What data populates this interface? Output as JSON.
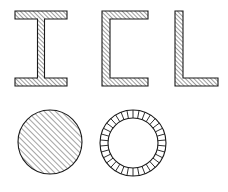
{
  "drawing": {
    "title": "Structural steel cross-sections",
    "background_color": "#ffffff",
    "line_color": "#1a1a1a",
    "hatch_color": "#4a4a4a",
    "canvas": {
      "width": 228,
      "height": 192
    },
    "row_count": 2,
    "shape_count": 5
  },
  "shapes": [
    {
      "id": "i-beam",
      "name": "I-beam section",
      "profile_letter": "I",
      "row": 1,
      "column": 1,
      "hatch_style": "diagonal-45",
      "hatch_spacing_px": 3,
      "bounds": {
        "x": 15,
        "y": 11,
        "width": 52,
        "height": 75
      },
      "flange_thickness_px": 8,
      "web_thickness_px": 7,
      "web_center_x": 41
    },
    {
      "id": "c-channel",
      "name": "C-channel section",
      "profile_letter": "C",
      "row": 1,
      "column": 2,
      "hatch_style": "diagonal-45",
      "hatch_spacing_px": 3,
      "bounds": {
        "x": 102,
        "y": 11,
        "width": 46,
        "height": 75
      },
      "flange_thickness_px": 8,
      "web_thickness_px": 8
    },
    {
      "id": "l-angle",
      "name": "L-angle section",
      "profile_letter": "L",
      "row": 1,
      "column": 3,
      "hatch_style": "diagonal-45",
      "hatch_spacing_px": 3,
      "bounds": {
        "x": 175,
        "y": 11,
        "width": 43,
        "height": 75
      },
      "leg_thickness_px": 8
    },
    {
      "id": "solid-round-bar",
      "name": "Solid round bar section",
      "profile_letter": "O",
      "row": 2,
      "column": 1,
      "hatch_style": "diagonal-45",
      "hatch_spacing_px": 4,
      "center": {
        "x": 50,
        "y": 142
      },
      "radius_px": 32
    },
    {
      "id": "hollow-tube",
      "name": "Hollow tube section",
      "profile_letter": "O",
      "row": 2,
      "column": 2,
      "hatch_style": "radial-ticks",
      "tick_count": 34,
      "center": {
        "x": 133,
        "y": 143
      },
      "outer_radius_px": 33,
      "inner_radius_px": 25
    }
  ]
}
